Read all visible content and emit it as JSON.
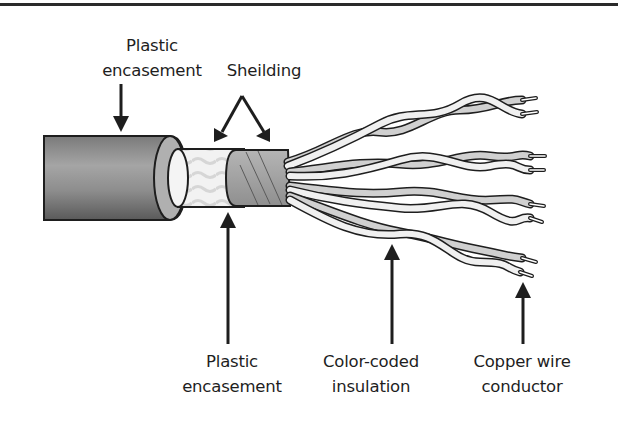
{
  "diagram": {
    "type": "labeled-illustration",
    "components": [
      {
        "id": "outer-jacket",
        "name": "Plastic encasement (outer)"
      },
      {
        "id": "shield-foil",
        "name": "Sheilding (foil)"
      },
      {
        "id": "shield-braid",
        "name": "Sheilding (braid)"
      },
      {
        "id": "inner-jacket",
        "name": "Plastic encasement (inner)"
      },
      {
        "id": "twisted-pairs",
        "name": "Color-coded insulation",
        "count": 4
      },
      {
        "id": "conductors",
        "name": "Copper wire conductor",
        "count": 8
      }
    ]
  },
  "labels": {
    "top_plastic": {
      "line1": "Plastic",
      "line2": "encasement"
    },
    "shielding": {
      "line1": "Sheilding"
    },
    "bottom_plastic": {
      "line1": "Plastic",
      "line2": "encasement"
    },
    "insulation": {
      "line1": "Color-coded",
      "line2": "insulation"
    },
    "conductor": {
      "line1": "Copper wire",
      "line2": "conductor"
    }
  },
  "colors": {
    "rule": "#2a2a2a",
    "outline": "#1e1e1e",
    "jacket_dark": "#6e6e6e",
    "jacket_light": "#bdbdbd",
    "foil": "#f0f0f0",
    "braid": "#a8a8a8",
    "wire_fill": "#d4d4d4",
    "wire_alt": "#eeeeee"
  }
}
